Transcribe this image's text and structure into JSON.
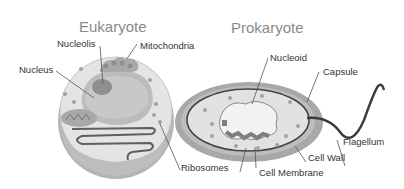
{
  "diagram": {
    "type": "cell-comparison",
    "style": "grayscale illustration",
    "colors": {
      "background": "#ffffff",
      "title_text": "#8a8a8a",
      "label_text": "#333333",
      "cytoplasm": "#e6e6e6",
      "cell_outer": "#b0b0b0",
      "organelle": "#a6a6a6",
      "dark_line": "#555555"
    }
  },
  "eukaryote": {
    "title": "Eukaryote",
    "labels": {
      "nucleolis": "Nucleolis",
      "mitochondria": "Mitochondria",
      "nucleus": "Nucleus",
      "ribosomes": "Ribosomes"
    }
  },
  "prokaryote": {
    "title": "Prokaryote",
    "labels": {
      "nucleoid": "Nucleoid",
      "capsule": "Capsule",
      "flagellum": "Flagellum",
      "cell_wall": "Cell Wall",
      "cell_membrane": "Cell Membrane"
    }
  }
}
